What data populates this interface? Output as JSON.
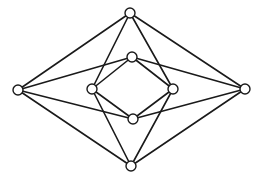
{
  "figure": {
    "type": "graph",
    "stroke_color": "#1a1a1a",
    "node_fill": "#ffffff",
    "node_radius": 5,
    "nodes": [
      {
        "id": "T",
        "label": "outer-top",
        "x": 130,
        "y": 13
      },
      {
        "id": "L",
        "label": "outer-left",
        "x": 18,
        "y": 90
      },
      {
        "id": "R",
        "label": "outer-right",
        "x": 245,
        "y": 89
      },
      {
        "id": "B",
        "label": "outer-bottom",
        "x": 131,
        "y": 166
      },
      {
        "id": "IT",
        "label": "inner-top",
        "x": 132,
        "y": 57
      },
      {
        "id": "IL",
        "label": "inner-left",
        "x": 92,
        "y": 89
      },
      {
        "id": "IR",
        "label": "inner-right",
        "x": 173,
        "y": 89
      },
      {
        "id": "IB",
        "label": "inner-bottom",
        "x": 133,
        "y": 119
      }
    ],
    "edges": [
      [
        "T",
        "L"
      ],
      [
        "T",
        "R"
      ],
      [
        "T",
        "IL"
      ],
      [
        "T",
        "IR"
      ],
      [
        "B",
        "L"
      ],
      [
        "B",
        "R"
      ],
      [
        "B",
        "IL"
      ],
      [
        "B",
        "IR"
      ],
      [
        "L",
        "IT"
      ],
      [
        "L",
        "IB"
      ],
      [
        "R",
        "IT"
      ],
      [
        "R",
        "IB"
      ],
      [
        "IT",
        "IL"
      ],
      [
        "IL",
        "IB"
      ],
      [
        "IB",
        "IR"
      ],
      [
        "IR",
        "IT"
      ]
    ]
  },
  "caption": {
    "visible": "partial",
    "text": ""
  }
}
